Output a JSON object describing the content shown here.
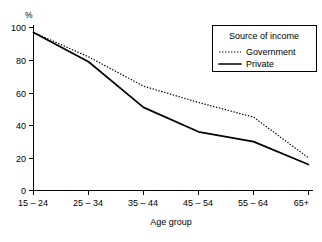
{
  "chart_data": {
    "type": "line",
    "title": "",
    "xlabel": "Age group",
    "ylabel": "%",
    "ylim": [
      0,
      100
    ],
    "yticks": [
      0,
      20,
      40,
      60,
      80,
      100
    ],
    "grid": false,
    "legend_position": "top-right",
    "legend_title": "Source of income",
    "categories": [
      "15 – 24",
      "25 – 34",
      "35 – 44",
      "45 – 54",
      "55 – 64",
      "65+"
    ],
    "series": [
      {
        "name": "Government",
        "style": "dotted",
        "color": "#000000",
        "values": [
          97,
          82,
          64,
          54,
          45,
          20
        ]
      },
      {
        "name": "Private",
        "style": "solid",
        "color": "#000000",
        "values": [
          97,
          79,
          51,
          36,
          30,
          16
        ]
      }
    ]
  },
  "axes": {
    "y_unit_label": "%",
    "x_axis_title": "Age group",
    "y_tick_labels": [
      "100",
      "80",
      "60",
      "40",
      "20",
      "0"
    ],
    "x_tick_labels": [
      "15 – 24",
      "25 – 34",
      "35 – 44",
      "45 – 54",
      "55 – 64",
      "65+"
    ]
  },
  "legend": {
    "title": "Source of income",
    "entries": [
      {
        "label": "Government",
        "swatch": "dotted-line-swatch"
      },
      {
        "label": "Private",
        "swatch": "solid-line-swatch"
      }
    ]
  }
}
